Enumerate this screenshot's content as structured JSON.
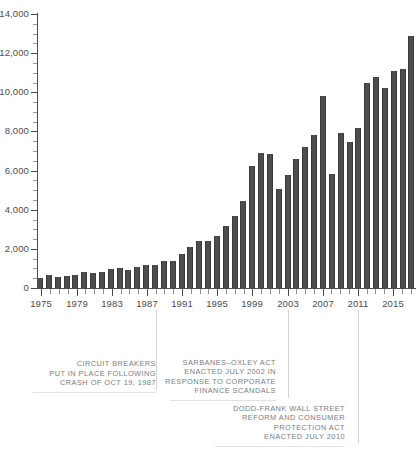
{
  "chart_data": {
    "type": "bar",
    "title": "",
    "subtitle": "",
    "xlabel": "",
    "ylabel": "",
    "ylim": [
      0,
      14000
    ],
    "xlim": [
      1975,
      2017
    ],
    "grid": false,
    "legend": null,
    "y_ticks": [
      0,
      2000,
      4000,
      6000,
      8000,
      10000,
      12000,
      14000
    ],
    "y_tick_labels": [
      "0",
      "2,000",
      "4,000",
      "6,000",
      "8,000",
      "10,000",
      "12,000",
      "14,000"
    ],
    "y_minor_tick_step": 500,
    "x_tick_labels": [
      "1975",
      "1979",
      "1983",
      "1987",
      "1991",
      "1995",
      "1999",
      "2003",
      "2007",
      "2011",
      "2015"
    ],
    "x_tick_step": 4,
    "bar_color": "#4d4d4d",
    "categories": [
      "1975",
      "1976",
      "1977",
      "1978",
      "1979",
      "1980",
      "1981",
      "1982",
      "1983",
      "1984",
      "1985",
      "1986",
      "1987",
      "1988",
      "1989",
      "1990",
      "1991",
      "1992",
      "1993",
      "1994",
      "1995",
      "1996",
      "1997",
      "1998",
      "1999",
      "2000",
      "2001",
      "2002",
      "2003",
      "2004",
      "2005",
      "2006",
      "2007",
      "2008",
      "2009",
      "2010",
      "2011",
      "2012",
      "2013",
      "2014",
      "2015",
      "2016",
      "2017"
    ],
    "values": [
      520,
      640,
      570,
      600,
      680,
      820,
      760,
      840,
      980,
      1020,
      930,
      1080,
      1180,
      1180,
      1370,
      1400,
      1760,
      2100,
      2420,
      2380,
      2670,
      3150,
      3700,
      4450,
      6250,
      6900,
      6850,
      5050,
      5750,
      6600,
      7200,
      7800,
      9800,
      5850,
      7900,
      7450,
      8200,
      10500,
      10800,
      10200,
      11100,
      11200,
      12900
    ]
  },
  "annotations": [
    {
      "name": "circuit-breakers",
      "lines": [
        "CIRCUIT BREAKERS",
        "PUT IN PLACE FOLLOWING",
        "CRASH OF OCT 19, 1987"
      ],
      "anchor_year": "1987"
    },
    {
      "name": "sarbanes-oxley",
      "lines": [
        "SARBANES–OXLEY ACT",
        "ENACTED JULY 2002 IN",
        "RESPONSE TO CORPORATE",
        "FINANCE SCANDALS"
      ],
      "anchor_year": "2002"
    },
    {
      "name": "dodd-frank",
      "lines": [
        "DODD-FRANK WALL STREET",
        "REFORM AND CONSUMER",
        "PROTECTION ACT",
        "ENACTED JULY 2010"
      ],
      "anchor_year": "2010"
    }
  ]
}
